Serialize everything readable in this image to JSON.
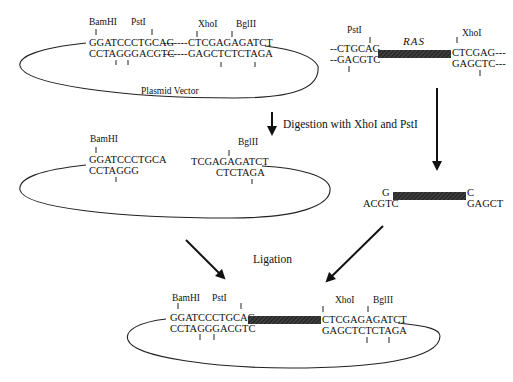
{
  "colors": {
    "ink": "#111111",
    "insert_bar": "#333333",
    "background": "#ffffff"
  },
  "top_plasmid": {
    "caption": "Plasmid Vector",
    "sites": {
      "bamhi": "BamHI",
      "psti": "PstI",
      "xhoi": "XhoI",
      "bglii": "BglII"
    },
    "top_strand_left": "GGATCCCTGCAG",
    "bottom_strand_left": "CCTAGGGACGTC",
    "dashes": "-------",
    "top_strand_right": "CTCGAGAGATCT",
    "bottom_strand_right": "GAGCTCTCTAGA"
  },
  "ras_gene": {
    "label": "RAS",
    "sites": {
      "psti": "PstI",
      "xhoi": "XhoI"
    },
    "top_left": "--CTGCAG",
    "bottom_left": "--GACGTC",
    "top_right": "CTCGAG---",
    "bottom_right": "GAGCTC---"
  },
  "step1": {
    "label": "Digestion with XhoI and PstI"
  },
  "digested_plasmid": {
    "sites": {
      "bamhi": "BamHI",
      "bglii": "BglII"
    },
    "top_left": "GGATCCCTGCA",
    "bottom_left": "CCTAGGG",
    "top_right": "TCGAGAGATCT",
    "bottom_right": "CTCTAGA"
  },
  "digested_insert": {
    "top_left": "G",
    "bottom_left": "ACGTC",
    "top_right": "C",
    "bottom_right": "GAGCT"
  },
  "step2": {
    "label": "Ligation"
  },
  "recombinant_plasmid": {
    "sites": {
      "bamhi": "BamHI",
      "psti": "PstI",
      "xhoi": "XhoI",
      "bglii": "BglII"
    },
    "top_left": "GGATCCCTGCAG",
    "bottom_left": "CCTAGGGACGTC",
    "top_right": "CTCGAGAGATCT",
    "bottom_right": "GAGCTCTCTAGA"
  }
}
